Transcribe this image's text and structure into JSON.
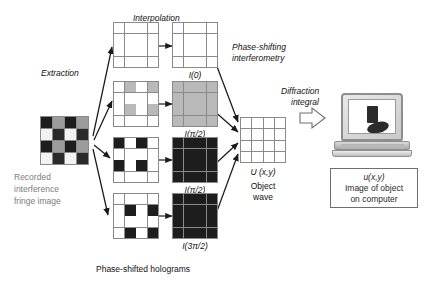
{
  "diagram": {
    "title_hidden": "Digital holography reconstruction pipeline",
    "labels": {
      "extraction": "Extraction",
      "interpolation": "Interpolation",
      "phase_shifting": "Phase-shifting",
      "interferometry": "interferometry",
      "diffraction": "Diffraction",
      "integral": "integral",
      "phase_shifted_holograms": "Phase-shifted holograms"
    },
    "source": {
      "name": "recorded-interference-fringe-image",
      "caption_lines": [
        "Recorded",
        "interference",
        "fringe image"
      ],
      "grid": {
        "rows": 4,
        "cols": 4,
        "cells": [
          [
            "#1d1d1d",
            "#9c9c9c",
            "#1d1d1d",
            "#9c9c9c"
          ],
          [
            "#f2f2f2",
            "#2a2a2a",
            "#f2f2f2",
            "#2a2a2a"
          ],
          [
            "#1d1d1d",
            "#9c9c9c",
            "#1d1d1d",
            "#9c9c9c"
          ],
          [
            "#f2f2f2",
            "#2a2a2a",
            "#f2f2f2",
            "#2a2a2a"
          ]
        ]
      }
    },
    "holograms": [
      {
        "name": "hologram-i0",
        "label": "I(0)",
        "label_math": {
          "italic": "I",
          "paren": "(0)"
        },
        "sparse": [
          [
            "#ffffff",
            "#ffffff",
            "#ffffff",
            "#ffffff"
          ],
          [
            "#ffffff",
            "#ffffff",
            "#ffffff",
            "#ffffff"
          ],
          [
            "#ffffff",
            "#ffffff",
            "#ffffff",
            "#ffffff"
          ],
          [
            "#ffffff",
            "#ffffff",
            "#ffffff",
            "#ffffff"
          ]
        ],
        "interpolated": [
          [
            "#ffffff",
            "#ffffff",
            "#ffffff",
            "#ffffff"
          ],
          [
            "#ffffff",
            "#ffffff",
            "#ffffff",
            "#ffffff"
          ],
          [
            "#ffffff",
            "#ffffff",
            "#ffffff",
            "#ffffff"
          ],
          [
            "#ffffff",
            "#ffffff",
            "#ffffff",
            "#ffffff"
          ]
        ]
      },
      {
        "name": "hologram-i-pi-2-a",
        "label": "I(π/2)",
        "label_math": {
          "italic": "I",
          "paren": "(π/2)"
        },
        "sparse": [
          [
            "#ffffff",
            "#b9b9b9",
            "#ffffff",
            "#b9b9b9"
          ],
          [
            "#ffffff",
            "#ffffff",
            "#ffffff",
            "#ffffff"
          ],
          [
            "#ffffff",
            "#b9b9b9",
            "#ffffff",
            "#b9b9b9"
          ],
          [
            "#ffffff",
            "#ffffff",
            "#ffffff",
            "#ffffff"
          ]
        ],
        "interpolated": [
          [
            "#b9b9b9",
            "#b9b9b9",
            "#b9b9b9",
            "#b9b9b9"
          ],
          [
            "#b9b9b9",
            "#b9b9b9",
            "#b9b9b9",
            "#b9b9b9"
          ],
          [
            "#b9b9b9",
            "#b9b9b9",
            "#b9b9b9",
            "#b9b9b9"
          ],
          [
            "#b9b9b9",
            "#b9b9b9",
            "#b9b9b9",
            "#b9b9b9"
          ]
        ]
      },
      {
        "name": "hologram-i-pi-2-b",
        "label": "I(π/2)",
        "label_math": {
          "italic": "I",
          "paren": "(π/2)"
        },
        "sparse": [
          [
            "#1d1d1d",
            "#ffffff",
            "#1d1d1d",
            "#ffffff"
          ],
          [
            "#ffffff",
            "#ffffff",
            "#ffffff",
            "#ffffff"
          ],
          [
            "#1d1d1d",
            "#ffffff",
            "#1d1d1d",
            "#ffffff"
          ],
          [
            "#ffffff",
            "#ffffff",
            "#ffffff",
            "#ffffff"
          ]
        ],
        "interpolated": [
          [
            "#1d1d1d",
            "#1d1d1d",
            "#1d1d1d",
            "#1d1d1d"
          ],
          [
            "#1d1d1d",
            "#1d1d1d",
            "#1d1d1d",
            "#1d1d1d"
          ],
          [
            "#1d1d1d",
            "#1d1d1d",
            "#1d1d1d",
            "#1d1d1d"
          ],
          [
            "#1d1d1d",
            "#1d1d1d",
            "#1d1d1d",
            "#1d1d1d"
          ]
        ]
      },
      {
        "name": "hologram-i-3pi-2",
        "label": "I(3π/2)",
        "label_math": {
          "italic": "I",
          "paren": "(3π/2)"
        },
        "sparse": [
          [
            "#ffffff",
            "#ffffff",
            "#ffffff",
            "#ffffff"
          ],
          [
            "#ffffff",
            "#1d1d1d",
            "#ffffff",
            "#1d1d1d"
          ],
          [
            "#ffffff",
            "#ffffff",
            "#ffffff",
            "#ffffff"
          ],
          [
            "#ffffff",
            "#1d1d1d",
            "#ffffff",
            "#1d1d1d"
          ]
        ],
        "interpolated": [
          [
            "#1d1d1d",
            "#1d1d1d",
            "#1d1d1d",
            "#1d1d1d"
          ],
          [
            "#1d1d1d",
            "#1d1d1d",
            "#1d1d1d",
            "#1d1d1d"
          ],
          [
            "#1d1d1d",
            "#1d1d1d",
            "#1d1d1d",
            "#1d1d1d"
          ],
          [
            "#1d1d1d",
            "#1d1d1d",
            "#1d1d1d",
            "#1d1d1d"
          ]
        ]
      }
    ],
    "object_wave": {
      "name": "object-wave-grid",
      "label": "U (x,y)",
      "label_math": {
        "italic_u": "U",
        "paren": "(x,y)"
      },
      "caption_lines": [
        "Object",
        "wave"
      ],
      "rows": 4,
      "cols": 4
    },
    "computer": {
      "name": "computer-laptop",
      "caption_lines": [
        "u(x,y)",
        "Image of object",
        "on computer"
      ],
      "caption_math": {
        "italic_u": "u",
        "paren": "(x,y)"
      }
    }
  },
  "colors": {
    "gridline": "#8a8a8a",
    "dark_cell": "#1d1d1d",
    "mid_cell": "#9c9c9c",
    "light_cell": "#b9b9b9",
    "white_cell": "#ffffff",
    "caption_gray": "#7d7d7d",
    "arrow": "#1a1a1a",
    "block_arrow_outline": "#6e6e6e"
  }
}
